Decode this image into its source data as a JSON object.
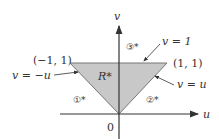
{
  "diagram": {
    "region_label": "R*",
    "region_fill": "#c8c8c8",
    "axis_color": "#333333",
    "axes": {
      "horizontal": "u",
      "vertical": "v",
      "origin": "0"
    },
    "vertices": [
      {
        "label": "(−1, 1)"
      },
      {
        "label": "(1, 1)"
      },
      {
        "label": "0"
      }
    ],
    "boundaries": [
      {
        "id": "1*",
        "symbol": "①*",
        "equation": "v = −u"
      },
      {
        "id": "2*",
        "symbol": "②*",
        "equation": "v = u"
      },
      {
        "id": "3*",
        "symbol": "③*",
        "equation": "v = 1"
      }
    ]
  }
}
